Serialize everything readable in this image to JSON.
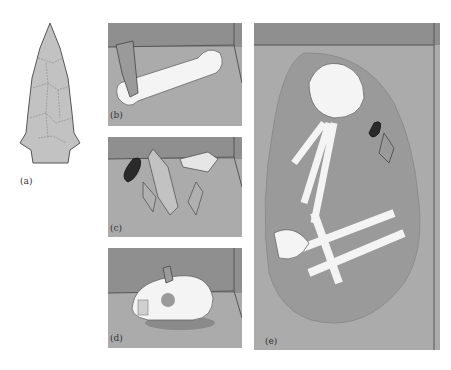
{
  "figure": {
    "colors": {
      "wall": "#8f8f8f",
      "floor": "#ababab",
      "pit": "#9a9a9a",
      "bone": "#f4f4f4",
      "stone": "#c2c2c2",
      "dark_stone": "#2a2a2a",
      "line": "#555555"
    },
    "panels": [
      {
        "id": "a",
        "label": "(a)",
        "content": "projectile point (isolated artifact)"
      },
      {
        "id": "b",
        "label": "(b)",
        "content": "projectile point embedded in long bone"
      },
      {
        "id": "c",
        "label": "(c)",
        "content": "cache of five projectile points"
      },
      {
        "id": "d",
        "label": "(d)",
        "content": "projectile point embedded in skull"
      },
      {
        "id": "e",
        "label": "(e)",
        "content": "flexed burial with two projectile points"
      }
    ]
  }
}
